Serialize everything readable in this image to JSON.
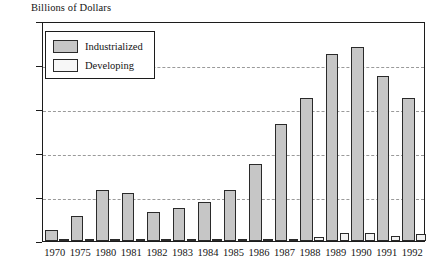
{
  "chart_data": {
    "type": "bar",
    "title": "Billions of Dollars",
    "xlabel": "",
    "ylabel": "Billions of Dollars",
    "ylim": [
      0,
      250
    ],
    "yticks": [
      0,
      50,
      100,
      150,
      200,
      250
    ],
    "grid": true,
    "legend_position": "top-left",
    "categories": [
      "1970",
      "1975",
      "1980",
      "1981",
      "1982",
      "1983",
      "1984",
      "1985",
      "1986",
      "1987",
      "1988",
      "1989",
      "1990",
      "1991",
      "1992"
    ],
    "series": [
      {
        "name": "Industrialized",
        "color": "#c6c6c6",
        "values": [
          12,
          28,
          58,
          55,
          33,
          37,
          44,
          58,
          87,
          133,
          162,
          213,
          221,
          187,
          162
        ]
      },
      {
        "name": "Developing",
        "color": "#f2f2f2",
        "values": [
          0,
          0,
          2,
          0,
          2,
          2,
          1,
          1,
          2,
          1,
          5,
          9,
          9,
          6,
          8
        ]
      }
    ]
  },
  "legend": {
    "items": [
      {
        "label": "Industrialized",
        "swatch": "industrialized"
      },
      {
        "label": "Developing",
        "swatch": "developing"
      }
    ]
  },
  "axis": {
    "y_tick_labels": [
      "250",
      "200",
      "150",
      "100",
      "50",
      "0"
    ]
  }
}
